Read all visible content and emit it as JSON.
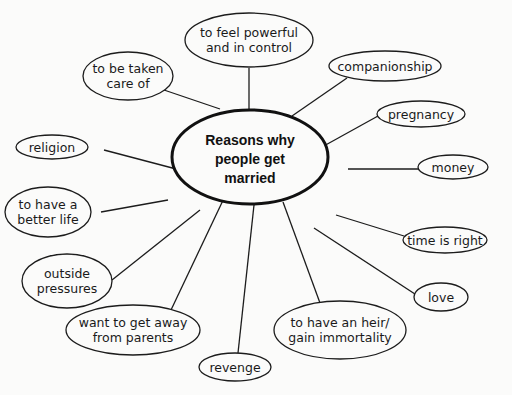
{
  "diagram": {
    "type": "mind-map",
    "center": {
      "lines": [
        "Reasons why",
        "people get",
        "married"
      ]
    },
    "nodes": [
      {
        "id": "powerful",
        "lines": [
          "to feel powerful",
          "and in control"
        ]
      },
      {
        "id": "companionship",
        "lines": [
          "companionship"
        ]
      },
      {
        "id": "pregnancy",
        "lines": [
          "pregnancy"
        ]
      },
      {
        "id": "money",
        "lines": [
          "money"
        ]
      },
      {
        "id": "time-is-right",
        "lines": [
          "time is right"
        ]
      },
      {
        "id": "love",
        "lines": [
          "love"
        ]
      },
      {
        "id": "heir",
        "lines": [
          "to have an heir/",
          "gain immortality"
        ]
      },
      {
        "id": "revenge",
        "lines": [
          "revenge"
        ]
      },
      {
        "id": "get-away",
        "lines": [
          "want to get away",
          "from parents"
        ]
      },
      {
        "id": "outside-pressures",
        "lines": [
          "outside",
          "pressures"
        ]
      },
      {
        "id": "better-life",
        "lines": [
          "to have a",
          "better life"
        ]
      },
      {
        "id": "religion",
        "lines": [
          "religion"
        ]
      },
      {
        "id": "taken-care",
        "lines": [
          "to be taken",
          "care of"
        ]
      }
    ]
  }
}
